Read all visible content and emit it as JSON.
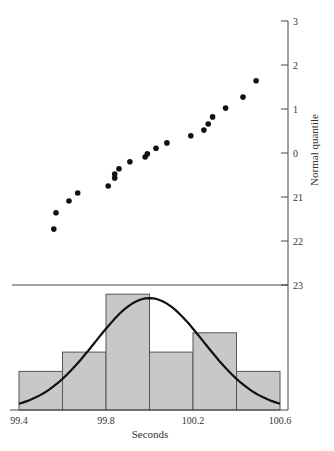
{
  "chart_data": [
    {
      "type": "scatter",
      "title": "",
      "xlabel": "",
      "ylabel": "Normal quantile",
      "ylim": [
        -3,
        3
      ],
      "ytick_labels": [
        "3",
        "2",
        "1",
        "0",
        "21",
        "22",
        "23"
      ],
      "ytick_values": [
        3,
        2,
        1,
        0,
        -1,
        -2,
        -3
      ],
      "y_axis_position": "right",
      "grid": false,
      "points": [
        {
          "x": 99.56,
          "y": -1.73
        },
        {
          "x": 99.57,
          "y": -1.36
        },
        {
          "x": 99.63,
          "y": -1.09
        },
        {
          "x": 99.67,
          "y": -0.91
        },
        {
          "x": 99.81,
          "y": -0.75
        },
        {
          "x": 99.84,
          "y": -0.57
        },
        {
          "x": 99.84,
          "y": -0.48
        },
        {
          "x": 99.86,
          "y": -0.36
        },
        {
          "x": 99.91,
          "y": -0.2
        },
        {
          "x": 99.98,
          "y": -0.09
        },
        {
          "x": 99.99,
          "y": -0.02
        },
        {
          "x": 100.03,
          "y": 0.11
        },
        {
          "x": 100.08,
          "y": 0.23
        },
        {
          "x": 100.19,
          "y": 0.39
        },
        {
          "x": 100.25,
          "y": 0.52
        },
        {
          "x": 100.27,
          "y": 0.66
        },
        {
          "x": 100.29,
          "y": 0.82
        },
        {
          "x": 100.35,
          "y": 1.02
        },
        {
          "x": 100.43,
          "y": 1.27
        },
        {
          "x": 100.49,
          "y": 1.64
        }
      ]
    },
    {
      "type": "bar",
      "subtype": "histogram",
      "title": "",
      "xlabel": "Seconds",
      "ylabel": "",
      "xlim": [
        99.4,
        100.6
      ],
      "xtick_labels": [
        "99.4",
        "99.8",
        "100.2",
        "100.6"
      ],
      "xtick_values": [
        99.4,
        99.8,
        100.2,
        100.6
      ],
      "bin_edges": [
        99.4,
        99.6,
        99.8,
        100.0,
        100.2,
        100.4,
        100.6
      ],
      "categories": [
        "99.4-99.6",
        "99.6-99.8",
        "99.8-100.0",
        "100.0-100.2",
        "100.2-100.4",
        "100.4-100.6"
      ],
      "values": [
        2,
        3,
        6,
        3,
        4,
        2
      ],
      "overlay": {
        "type": "normal_curve",
        "mean": 100.0,
        "peak_count": 5.8
      },
      "bar_fill": "#c8c8c8",
      "bar_edge": "#555555",
      "curve_color": "#111111"
    }
  ],
  "labels": {
    "y_axis_title": "Normal quantile",
    "x_axis_title": "Seconds"
  }
}
